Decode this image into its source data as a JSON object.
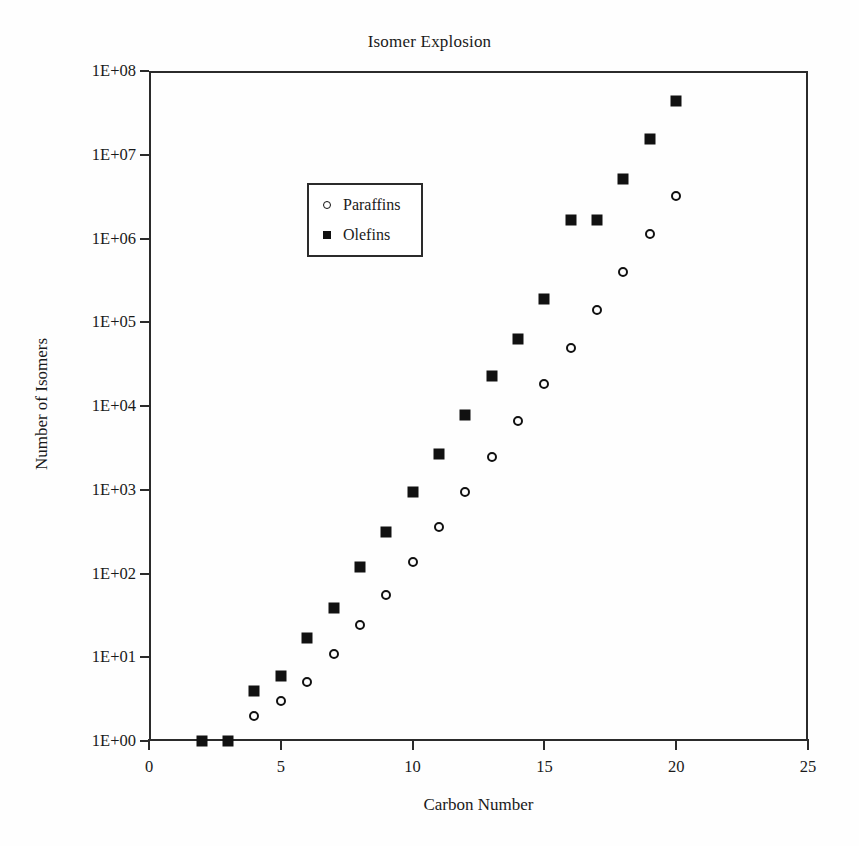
{
  "chart_data": {
    "type": "scatter",
    "title": "Isomer Explosion",
    "xlabel": "Carbon Number",
    "ylabel": "Number of Isomers",
    "xlim": [
      0,
      25
    ],
    "ylim": [
      1,
      100000000
    ],
    "yscale": "log",
    "grid": false,
    "legend_position": "top-left",
    "xticks": [
      "0",
      "5",
      "10",
      "15",
      "20",
      "25"
    ],
    "xtick_values": [
      0,
      5,
      10,
      15,
      20,
      25
    ],
    "yticks": [
      "1E+00",
      "1E+01",
      "1E+02",
      "1E+03",
      "1E+04",
      "1E+05",
      "1E+06",
      "1E+07",
      "1E+08"
    ],
    "ytick_values": [
      1,
      10,
      100,
      1000,
      10000,
      100000,
      1000000,
      10000000,
      100000000
    ],
    "x": [
      2,
      3,
      4,
      5,
      6,
      7,
      8,
      9,
      10,
      11,
      12,
      13,
      14,
      15,
      16,
      17,
      18,
      19,
      20
    ],
    "series": [
      {
        "name": "Paraffins",
        "marker": "open-circle",
        "color": "#111111",
        "values": [
          1,
          1,
          2,
          3,
          5,
          11,
          24,
          55,
          136,
          355,
          943,
          2487,
          6700,
          18127,
          49877,
          139275,
          394129,
          1128876,
          3259553
        ]
      },
      {
        "name": "Olefins",
        "marker": "filled-square",
        "color": "#111111",
        "values": [
          1,
          1,
          4,
          6,
          17,
          39,
          118,
          311,
          929,
          2663,
          7783,
          22963,
          62885,
          188083,
          1645113,
          1645113,
          5065357,
          15503574,
          43806540
        ]
      }
    ]
  },
  "legend": {
    "entries": [
      {
        "label": "Paraffins",
        "marker": "open-circle"
      },
      {
        "label": "Olefins",
        "marker": "filled-square"
      }
    ]
  }
}
